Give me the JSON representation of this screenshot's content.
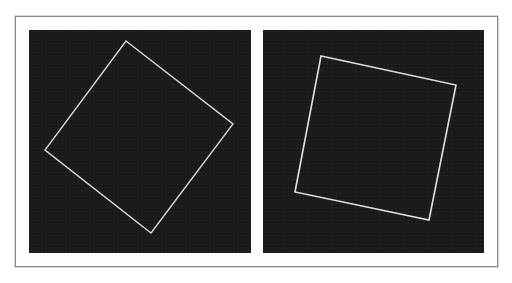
{
  "figure": {
    "panels": [
      {
        "id": "left",
        "description": "square outline rotated about 38 degrees on dark background",
        "background_color": "#1c1c1c",
        "line_color": "#d8d8d8",
        "vertices": [
          [
            97,
            11
          ],
          [
            204,
            94
          ],
          [
            122,
            203
          ],
          [
            16,
            120
          ]
        ]
      },
      {
        "id": "right",
        "description": "square outline rotated about 12 degrees on dark background",
        "background_color": "#1c1c1c",
        "line_color": "#e0e0e0",
        "vertices": [
          [
            58,
            26
          ],
          [
            193,
            55
          ],
          [
            166,
            190
          ],
          [
            32,
            162
          ]
        ]
      }
    ],
    "frame_border_color": "#8a8a8a"
  }
}
